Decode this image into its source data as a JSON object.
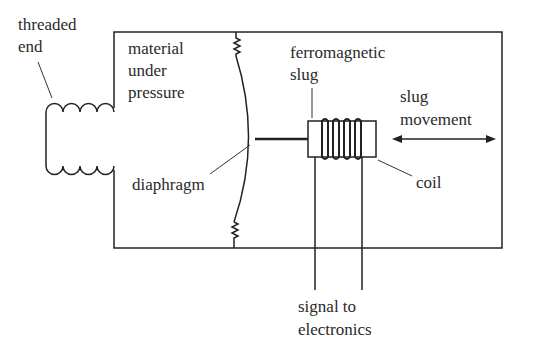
{
  "diagram": {
    "labels": {
      "threaded_end": [
        "threaded",
        "end"
      ],
      "material": [
        "material",
        "under",
        "pressure"
      ],
      "slug": [
        "ferromagnetic",
        "slug"
      ],
      "movement": [
        "slug",
        "movement"
      ],
      "diaphragm": "diaphragm",
      "coil": "coil",
      "signal": [
        "signal to",
        "electronics"
      ]
    }
  }
}
